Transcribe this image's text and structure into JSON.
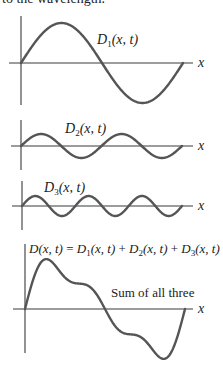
{
  "header": {
    "text": "to the wavelength."
  },
  "panels": [
    {
      "id": "d1",
      "label_name": "D",
      "label_sub": "1",
      "label_args": "(x, t)",
      "axis_label": "x",
      "cycles": 1,
      "amplitude": 1.0
    },
    {
      "id": "d2",
      "label_name": "D",
      "label_sub": "2",
      "label_args": "(x, t)",
      "axis_label": "x",
      "cycles": 2,
      "amplitude": 0.3
    },
    {
      "id": "d3",
      "label_name": "D",
      "label_sub": "3",
      "label_args": "(x, t)",
      "axis_label": "x",
      "cycles": 3,
      "amplitude": 0.25
    },
    {
      "id": "sum",
      "equation": {
        "lhs": "D(x, t)",
        "eq": " = ",
        "terms": [
          {
            "name": "D",
            "sub": "1",
            "args": "(x, t)"
          },
          {
            "name": "D",
            "sub": "2",
            "args": "(x, t)"
          },
          {
            "name": "D",
            "sub": "3",
            "args": "(x, t)"
          }
        ],
        "plus": " + "
      },
      "annotation": "Sum of all three",
      "axis_label": "x"
    }
  ],
  "colors": {
    "wave": "#555555",
    "axis": "#3a3a3a",
    "text": "#222222"
  }
}
